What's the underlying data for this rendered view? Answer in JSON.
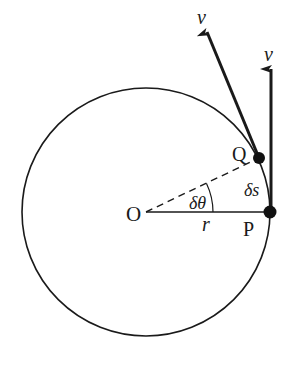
{
  "diagram": {
    "type": "circular-motion-velocity-diagram",
    "colors": {
      "stroke": "#1a1a1a",
      "background": "#ffffff"
    },
    "circle": {
      "cx": 146,
      "cy": 212,
      "r": 124
    },
    "points": {
      "O": {
        "label": "O",
        "x": 146,
        "y": 212
      },
      "P": {
        "label": "P",
        "x": 270,
        "y": 212
      },
      "Q": {
        "label": "Q",
        "x": 259,
        "y": 158
      }
    },
    "labels": {
      "radius": "r",
      "angle": "δθ",
      "arc": "δs",
      "velocity_at_q": "v",
      "velocity_at_p": "v"
    },
    "vectors": [
      {
        "name": "velocity at Q",
        "from": "Q",
        "label": "v",
        "direction": "tangent"
      },
      {
        "name": "velocity at P",
        "from": "P",
        "label": "v",
        "direction": "vertical-up"
      }
    ]
  }
}
